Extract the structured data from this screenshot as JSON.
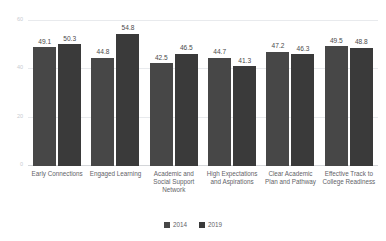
{
  "chart_data": {
    "type": "bar",
    "title": "",
    "subtitle": "",
    "xlabel": "",
    "ylabel": "",
    "ylim": [
      0,
      60
    ],
    "yticks": [
      0,
      20,
      40,
      60
    ],
    "grid": true,
    "legend_position": "bottom",
    "categories": [
      "Early Connections",
      "Engaged Learning",
      "Academic and Social Support Network",
      "High Expectations and Aspirations",
      "Clear Academic Plan and Pathway",
      "Effective Track to College Readiness"
    ],
    "series": [
      {
        "name": "2014",
        "color": "#474747",
        "values": [
          49.1,
          44.8,
          42.5,
          44.7,
          47.2,
          49.5
        ],
        "labels": [
          "49.1",
          "44.8",
          "42.5",
          "44.7",
          "47.2",
          "49.5"
        ]
      },
      {
        "name": "2019",
        "color": "#3a3a3a",
        "values": [
          50.3,
          54.8,
          46.5,
          41.3,
          46.3,
          48.8
        ],
        "labels": [
          "50.3",
          "54.8",
          "46.5",
          "41.3",
          "46.3",
          "48.8"
        ]
      }
    ]
  },
  "axis": {
    "ytick_labels": [
      "60",
      "40",
      "20",
      "0"
    ]
  },
  "legend": {
    "items": [
      {
        "label": "2014"
      },
      {
        "label": "2019"
      }
    ]
  }
}
